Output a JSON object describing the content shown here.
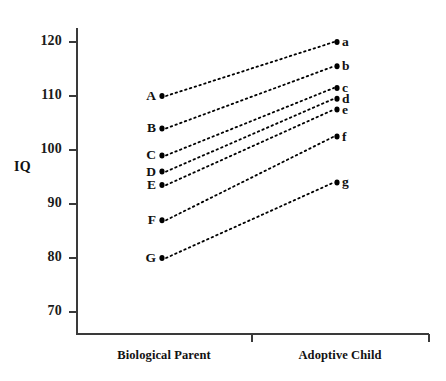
{
  "chart_data": {
    "type": "line",
    "title": "",
    "xlabel": "",
    "ylabel": "IQ",
    "categories": [
      "Biological Parent",
      "Adoptive Child"
    ],
    "ylim": [
      70,
      125
    ],
    "yticks": [
      70,
      80,
      90,
      100,
      110,
      120
    ],
    "grid": false,
    "legend_position": "none",
    "note": "Dotted slope lines connecting each biological parent's IQ (left labels A-G) to the corresponding adoptive child's IQ (right labels a-g)",
    "series": [
      {
        "name": "A",
        "left_label": "A",
        "right_label": "a",
        "values": [
          110,
          120
        ]
      },
      {
        "name": "B",
        "left_label": "B",
        "right_label": "b",
        "values": [
          104,
          115.5
        ]
      },
      {
        "name": "C",
        "left_label": "C",
        "right_label": "c",
        "values": [
          99,
          111.5
        ]
      },
      {
        "name": "D",
        "left_label": "D",
        "right_label": "d",
        "values": [
          96,
          109.5
        ]
      },
      {
        "name": "E",
        "left_label": "E",
        "right_label": "e",
        "values": [
          93.5,
          107.5
        ]
      },
      {
        "name": "F",
        "left_label": "F",
        "right_label": "f",
        "values": [
          87,
          102.5
        ]
      },
      {
        "name": "G",
        "left_label": "G",
        "right_label": "g",
        "values": [
          80,
          94
        ]
      }
    ]
  },
  "axis": {
    "y_title": "IQ",
    "y_tick_labels": [
      "120",
      "110",
      "100",
      "90",
      "80",
      "70"
    ],
    "x_tick_labels": [
      "Biological Parent",
      "Adoptive Child"
    ]
  },
  "colors": {
    "axis": "#3a3a3a",
    "text": "#111111",
    "marker": "#000000",
    "line": "#000000",
    "background": "#ffffff"
  }
}
